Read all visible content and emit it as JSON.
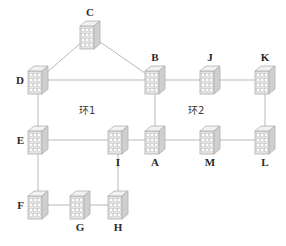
{
  "diagram": {
    "type": "network-topology",
    "title": "",
    "colors": {
      "edge": "#b9b9b9",
      "node_fill": "#e4e4e4",
      "node_stroke": "#b0b0b0",
      "node_top": "#f1f1f1",
      "node_side": "#cfcfcf",
      "port": "#ffffff",
      "label": "#2b2b2b",
      "background": "#ffffff"
    },
    "nodes": [
      {
        "id": "C",
        "label": "C",
        "x": 90,
        "y": 35,
        "label_pos": "top",
        "icon": "switch-icon"
      },
      {
        "id": "D",
        "label": "D",
        "x": 38,
        "y": 80,
        "label_pos": "left",
        "icon": "switch-icon"
      },
      {
        "id": "B",
        "label": "B",
        "x": 155,
        "y": 80,
        "label_pos": "top",
        "icon": "switch-icon"
      },
      {
        "id": "J",
        "label": "J",
        "x": 210,
        "y": 80,
        "label_pos": "top",
        "icon": "switch-icon"
      },
      {
        "id": "K",
        "label": "K",
        "x": 265,
        "y": 80,
        "label_pos": "top",
        "icon": "switch-icon"
      },
      {
        "id": "E",
        "label": "E",
        "x": 38,
        "y": 140,
        "label_pos": "left",
        "icon": "switch-icon"
      },
      {
        "id": "I",
        "label": "I",
        "x": 118,
        "y": 140,
        "label_pos": "bottom",
        "icon": "switch-icon"
      },
      {
        "id": "A",
        "label": "A",
        "x": 155,
        "y": 140,
        "label_pos": "bottom",
        "icon": "switch-icon"
      },
      {
        "id": "M",
        "label": "M",
        "x": 210,
        "y": 140,
        "label_pos": "bottom",
        "icon": "switch-icon"
      },
      {
        "id": "L",
        "label": "L",
        "x": 265,
        "y": 140,
        "label_pos": "bottom",
        "icon": "switch-icon"
      },
      {
        "id": "F",
        "label": "F",
        "x": 38,
        "y": 205,
        "label_pos": "left",
        "icon": "switch-icon"
      },
      {
        "id": "G",
        "label": "G",
        "x": 80,
        "y": 205,
        "label_pos": "bottom",
        "icon": "switch-icon"
      },
      {
        "id": "H",
        "label": "H",
        "x": 118,
        "y": 205,
        "label_pos": "bottom",
        "icon": "switch-icon"
      }
    ],
    "edges": [
      {
        "from": "C",
        "to": "D"
      },
      {
        "from": "C",
        "to": "B"
      },
      {
        "from": "D",
        "to": "B"
      },
      {
        "from": "B",
        "to": "J"
      },
      {
        "from": "J",
        "to": "K"
      },
      {
        "from": "D",
        "to": "E"
      },
      {
        "from": "E",
        "to": "F"
      },
      {
        "from": "B",
        "to": "A"
      },
      {
        "from": "K",
        "to": "L"
      },
      {
        "from": "E",
        "to": "I"
      },
      {
        "from": "I",
        "to": "A"
      },
      {
        "from": "A",
        "to": "M"
      },
      {
        "from": "M",
        "to": "L"
      },
      {
        "from": "I",
        "to": "H"
      },
      {
        "from": "F",
        "to": "G"
      },
      {
        "from": "G",
        "to": "H"
      }
    ],
    "annotations": [
      {
        "id": "ring1",
        "text": "环1",
        "x": 79,
        "y": 105
      },
      {
        "id": "ring2",
        "text": "环2",
        "x": 188,
        "y": 105
      }
    ]
  }
}
